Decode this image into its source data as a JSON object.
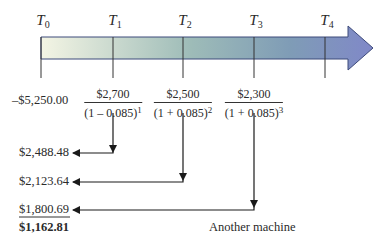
{
  "timeline": {
    "periods": [
      {
        "label": "T",
        "sub": "0"
      },
      {
        "label": "T",
        "sub": "1"
      },
      {
        "label": "T",
        "sub": "2"
      },
      {
        "label": "T",
        "sub": "3"
      },
      {
        "label": "T",
        "sub": "4"
      }
    ],
    "gradient_start": "#f3f4e2",
    "gradient_mid": "#8fb0b4",
    "gradient_end": "#8088c8"
  },
  "initial_outlay": "–$5,250.00",
  "cash_flows": [
    {
      "numerator": "$2,700",
      "den_base": "(1 – 0.085)",
      "exponent": "1"
    },
    {
      "numerator": "$2,500",
      "den_base": "(1 + 0.085)",
      "exponent": "2"
    },
    {
      "numerator": "$2,300",
      "den_base": "(1 + 0.085)",
      "exponent": "3"
    }
  ],
  "present_values": [
    "$2,488.48",
    "$2,123.64",
    "$1,800.69"
  ],
  "total": "$1,162.81",
  "caption": "Another machine"
}
